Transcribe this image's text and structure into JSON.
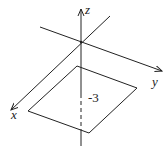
{
  "diagram": {
    "type": "3d-coordinate-axes",
    "axes": {
      "x": {
        "label": "x"
      },
      "y": {
        "label": "y"
      },
      "z": {
        "label": "z"
      }
    },
    "plane": {
      "shape": "parallelogram",
      "z_value_label": "-3"
    },
    "colors": {
      "line": "#222222",
      "background": "#ffffff"
    }
  }
}
